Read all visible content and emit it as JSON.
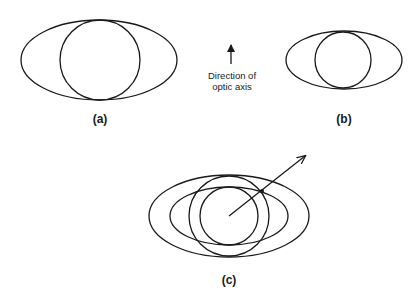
{
  "figure": {
    "stroke_color": "#1a1a1a",
    "panels": [
      {
        "id": "a",
        "label": "(a)",
        "ellipse": {
          "cx": 99,
          "cy": 60,
          "rx": 78,
          "ry": 40
        },
        "circle": {
          "cx": 100,
          "cy": 60,
          "r": 40
        }
      },
      {
        "id": "b",
        "label": "(b)",
        "ellipse": {
          "cx": 344,
          "cy": 60,
          "rx": 58,
          "ry": 29
        },
        "circle": {
          "cx": 343,
          "cy": 60,
          "r": 28
        }
      },
      {
        "id": "c",
        "label": "(c)",
        "ellipses": [
          {
            "cx": 229,
            "cy": 216,
            "rx": 80,
            "ry": 41
          },
          {
            "cx": 229,
            "cy": 216,
            "rx": 59,
            "ry": 29
          }
        ],
        "circles": [
          {
            "cx": 229,
            "cy": 216,
            "r": 40
          },
          {
            "cx": 229,
            "cy": 216,
            "r": 29
          }
        ],
        "arrow": {
          "x1": 229,
          "y1": 216,
          "x2": 305,
          "y2": 156
        },
        "intersection_dot": {
          "cx": 262,
          "cy": 191
        }
      }
    ],
    "optic_axis": {
      "label_line1": "Direction of",
      "label_line2": "optic axis",
      "arrow": {
        "x": 231,
        "y_tip": 43,
        "y_base": 64
      }
    }
  }
}
